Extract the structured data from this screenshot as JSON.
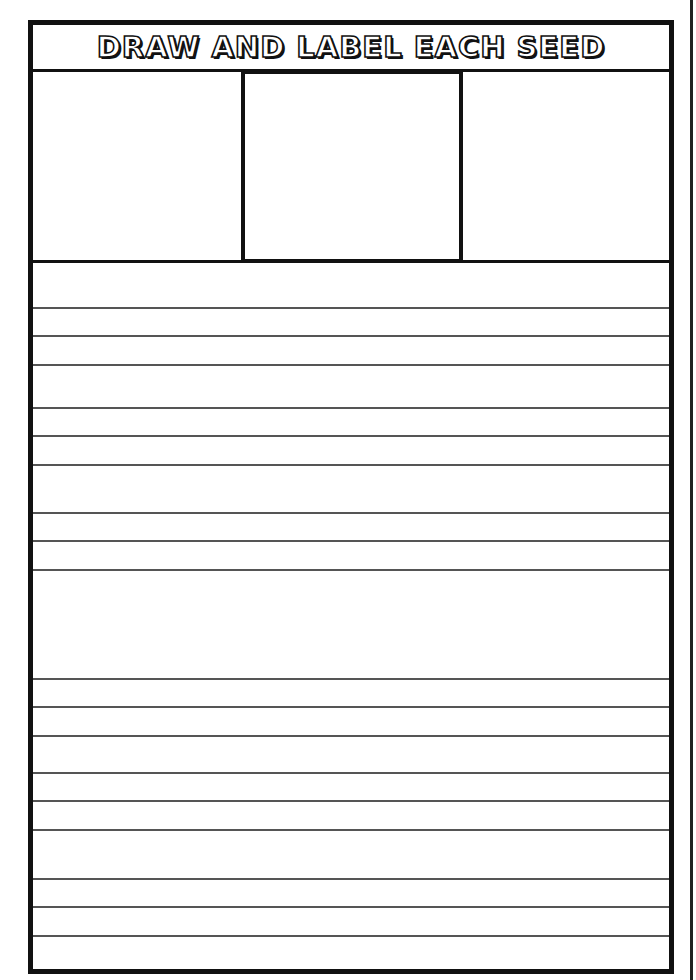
{
  "worksheet": {
    "title": "DRAW AND LABEL EACH SEED",
    "drawing_boxes": [
      {
        "id": "seed-1",
        "label": ""
      },
      {
        "id": "seed-2",
        "label": ""
      },
      {
        "id": "seed-3",
        "label": ""
      }
    ],
    "writing_line_groups": [
      {
        "lines": [
          308,
          336,
          365
        ]
      },
      {
        "lines": [
          408,
          436,
          465
        ]
      },
      {
        "lines": [
          513,
          541,
          570
        ]
      },
      {
        "lines": [
          679,
          707,
          736
        ]
      },
      {
        "lines": [
          773,
          801,
          830
        ]
      },
      {
        "lines": [
          879,
          907,
          936
        ]
      }
    ]
  }
}
